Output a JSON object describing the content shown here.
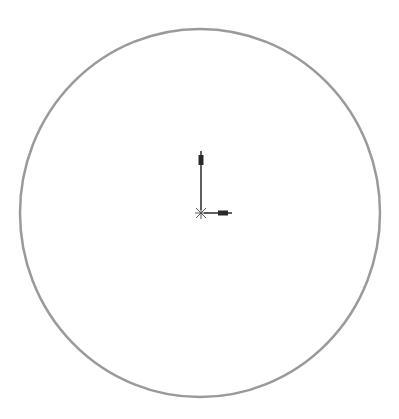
{
  "sketch": {
    "background": "#ffffff",
    "circle": {
      "cx": 200,
      "cy": 213,
      "rx": 180,
      "ry": 184,
      "stroke": "#9a9a9a",
      "stroke_width": 2.5
    },
    "origin": {
      "x": 201,
      "y": 213,
      "color": "#2a2a2a",
      "marker_icon": "origin-cross-icon",
      "y_axis_arrow": {
        "length": 62,
        "icon": "arrow-up-icon"
      },
      "x_axis_arrow": {
        "length": 31,
        "icon": "arrow-right-icon"
      }
    }
  }
}
